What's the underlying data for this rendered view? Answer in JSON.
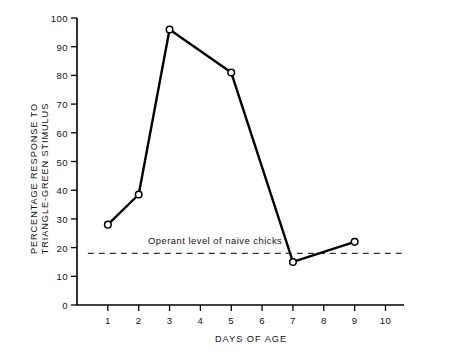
{
  "chart_data": {
    "type": "line",
    "title": "",
    "xlabel": "DAYS OF AGE",
    "ylabel_line1": "PERCENTAGE RESPONSE TO",
    "ylabel_line2": "TRIANGLE-GREEN STIMULUS",
    "x": [
      1,
      2,
      3,
      5,
      7,
      9
    ],
    "values": [
      28,
      38.5,
      96,
      81,
      15,
      22
    ],
    "series": [
      {
        "name": "Percentage response to triangle-green stimulus",
        "x": [
          1,
          2,
          3,
          5,
          7,
          9
        ],
        "values": [
          28,
          38.5,
          96,
          81,
          15,
          22
        ],
        "marker": "open-circle",
        "line_style": "solid",
        "color": "#000000"
      }
    ],
    "xlim": [
      0,
      10.6
    ],
    "ylim": [
      0,
      100
    ],
    "xticks": [
      1,
      2,
      3,
      4,
      5,
      6,
      7,
      8,
      9,
      10
    ],
    "xtick_labels": [
      "1",
      "2",
      "3",
      "4",
      "5",
      "6",
      "7",
      "8",
      "9",
      "10"
    ],
    "yticks": [
      0,
      10,
      20,
      30,
      40,
      50,
      60,
      70,
      80,
      90,
      100
    ],
    "ytick_labels": [
      "0",
      "10",
      "20",
      "30",
      "40",
      "50",
      "60",
      "70",
      "80",
      "90",
      "100"
    ],
    "grid": false,
    "legend": false,
    "legend_position": "none",
    "annotations": [
      {
        "name": "operant-level-label",
        "text": "Operant level of naive chicks",
        "x": 2.3,
        "y": 20.5
      }
    ],
    "reference_lines": [
      {
        "name": "operant-level-line",
        "orientation": "horizontal",
        "value": 18,
        "style": "dashed",
        "color": "#333333",
        "x_start": 0.35,
        "x_end": 10.6
      }
    ],
    "colors": {
      "background": "#ffffff",
      "axis": "#000000",
      "line": "#000000",
      "marker_fill": "#ffffff",
      "marker_edge": "#000000",
      "reference_line": "#333333",
      "text": "#141414"
    }
  }
}
